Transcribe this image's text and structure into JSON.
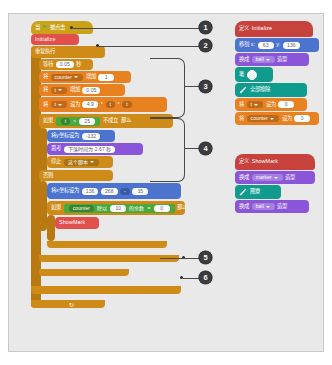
{
  "app": {
    "title": "Scratch block script editor",
    "canvas_bg": "#e9e9ea",
    "colors": {
      "control": "#cf8b17",
      "motion": "#4c74cf",
      "variables": "#e8811f",
      "operators": "#4aa83c",
      "looks": "#8a55d8",
      "pen": "#0f9c8f",
      "events": "#c9a21a",
      "my_blocks": "#e1504b",
      "sensing": "#3da2c4",
      "callout": "#3c3c3c"
    }
  },
  "main_script": {
    "hat": {
      "label_left": "当",
      "icon": "green-flag-icon",
      "label_right": "被点击"
    },
    "call_initialize": {
      "label": "Initialize"
    },
    "forever": {
      "label": "重复执行"
    },
    "wait": {
      "label_left": "等待",
      "value": "0.05",
      "label_right": "秒"
    },
    "change_counter": {
      "label_left": "将",
      "variable": "counter",
      "label_mid": "增加",
      "value": "1"
    },
    "change_t": {
      "label_left": "将",
      "variable": "t",
      "label_mid": "增加",
      "value": "0.05"
    },
    "set_h": {
      "label_left": "将",
      "variable": "h",
      "label_mid": "设为",
      "value_a": "4.9",
      "op1": "*",
      "value_b": "t",
      "op2": "*",
      "value_c": "t"
    },
    "if_block": {
      "label": "如果",
      "cond_a": "t",
      "cond_op": ">",
      "cond_b": "25",
      "label_mid": "不成立",
      "label_right": "那么"
    },
    "set_y": {
      "label": "将y坐标设为",
      "value": "-132"
    },
    "say": {
      "label": "思考",
      "value": "下落时间为 2.67 秒"
    },
    "stop": {
      "label": "停止",
      "option": "这个脚本"
    },
    "else_label": "否则",
    "goto_xy": {
      "label": "将x坐标设为",
      "value_x": "136",
      "value_y": "268",
      "op": "-",
      "value_z": "35"
    },
    "if_mod": {
      "label": "如果",
      "var": "counter",
      "label_mod": "除以",
      "value_div": "10",
      "label_eq": "的余数",
      "op": "=",
      "value_eq": "0",
      "label_then": "那么"
    },
    "call_showmark": {
      "label": "ShowMark"
    },
    "loop_arrow": "↻"
  },
  "def_initialize": {
    "header": {
      "label_left": "定义",
      "name": "Initialize"
    },
    "goto": {
      "label_left": "移到 x:",
      "value_x": "63",
      "label_y": "y:",
      "value_y": "136"
    },
    "switch_costume": {
      "label_left": "换成",
      "costume": "ball",
      "label_right": "造型"
    },
    "pen_erase": {
      "label": "全部擦除",
      "icon": "pen-icon"
    },
    "pen_color": {
      "label": "笔",
      "swatch": "pen-color-swatch"
    },
    "set_t": {
      "label_left": "将",
      "variable": "t",
      "label_mid": "设为",
      "value": "0"
    },
    "set_counter": {
      "label_left": "将",
      "variable": "counter",
      "label_mid": "设为",
      "value": "0"
    }
  },
  "def_showmark": {
    "header": {
      "label_left": "定义",
      "name": "ShowMark"
    },
    "switch_costume_marker": {
      "label_left": "换成",
      "costume": "marker",
      "label_right": "造型"
    },
    "pen_stamp": {
      "label": "图章",
      "icon": "pen-icon"
    },
    "switch_costume_ball": {
      "label_left": "换成",
      "costume": "ball",
      "label_right": "造型"
    }
  },
  "callouts": [
    {
      "number": "1"
    },
    {
      "number": "2"
    },
    {
      "number": "3"
    },
    {
      "number": "4"
    },
    {
      "number": "5"
    },
    {
      "number": "6"
    }
  ]
}
